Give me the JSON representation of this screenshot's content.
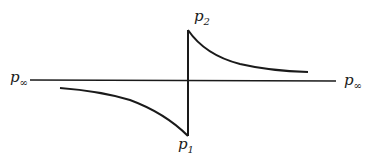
{
  "diagram": {
    "colors": {
      "stroke": "#1a1a1a",
      "background": "#ffffff"
    },
    "labels": {
      "p2": {
        "base": "p",
        "sub": "2"
      },
      "p1": {
        "base": "p",
        "sub": "1"
      },
      "p_inf_left": {
        "base": "p",
        "sub": "∞"
      },
      "p_inf_right": {
        "base": "p",
        "sub": "∞"
      }
    },
    "elements": [
      "horizontal baseline at ambient level p∞",
      "vertical jump from p1 (below) to p2 (above)",
      "upper curve decaying from p2 toward p∞",
      "lower curve rising from p∞ down to p1"
    ]
  }
}
